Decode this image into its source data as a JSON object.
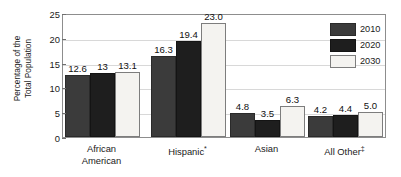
{
  "chart_data": {
    "type": "bar",
    "title": "",
    "xlabel": "",
    "ylabel": "Percentage of the\nTotal Population",
    "ylim": [
      0,
      25
    ],
    "yticks": [
      0,
      5,
      10,
      15,
      20,
      25
    ],
    "ytick_labels": [
      "0",
      "5",
      "10",
      "15",
      "20",
      "25"
    ],
    "grid": true,
    "grid_axis": "y",
    "legend_position": "upper right",
    "categories": [
      {
        "label": "African\nAmerican",
        "marker": ""
      },
      {
        "label": "Hispanic",
        "marker": "*"
      },
      {
        "label": "Asian",
        "marker": ""
      },
      {
        "label": "All Other",
        "marker": "‡"
      }
    ],
    "series": [
      {
        "name": "2010",
        "color": "#3b3b3b",
        "values": [
          12.6,
          16.3,
          4.8,
          4.2
        ],
        "labels": [
          "12.6",
          "16.3",
          "4.8",
          "4.2"
        ]
      },
      {
        "name": "2020",
        "color": "#1e1e1e",
        "values": [
          13.0,
          19.4,
          3.5,
          4.4
        ],
        "labels": [
          "13",
          "19.4",
          "3.5",
          "4.4"
        ]
      },
      {
        "name": "2030",
        "color": "#f4f3f0",
        "values": [
          13.1,
          23.0,
          6.3,
          5.0
        ],
        "labels": [
          "13.1",
          "23.0",
          "6.3",
          "5.0"
        ]
      }
    ]
  },
  "legend": {
    "entries": [
      {
        "label": "2010"
      },
      {
        "label": "2020"
      },
      {
        "label": "2030"
      }
    ]
  }
}
